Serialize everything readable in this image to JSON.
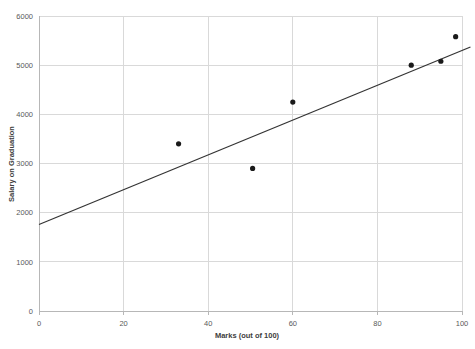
{
  "chart_data": {
    "type": "scatter",
    "title": "",
    "xlabel": "Marks (out of 100)",
    "ylabel": "Salary on Graduation",
    "xlim": [
      0,
      100
    ],
    "ylim": [
      0,
      6000
    ],
    "xticks": [
      0,
      20,
      40,
      60,
      80,
      100
    ],
    "yticks": [
      0,
      1000,
      2000,
      3000,
      4000,
      5000,
      6000
    ],
    "xtick_labels": [
      "0",
      "20",
      "40",
      "60",
      "80",
      "100"
    ],
    "ytick_labels": [
      "0",
      "1000",
      "2000",
      "3000",
      "4000",
      "5000",
      "6000"
    ],
    "grid": "horizontal-and-vertical",
    "legend": "none",
    "points": [
      {
        "x": 33,
        "y": 3400
      },
      {
        "x": 50.5,
        "y": 2900
      },
      {
        "x": 60,
        "y": 4250
      },
      {
        "x": 88,
        "y": 5000
      },
      {
        "x": 95,
        "y": 5080
      },
      {
        "x": 98.5,
        "y": 5580
      }
    ],
    "series": [
      {
        "name": "Salary on Graduation",
        "x": [
          33,
          50.5,
          60,
          88,
          95,
          98.5
        ],
        "values": [
          3400,
          2900,
          4250,
          5000,
          5080,
          5580
        ]
      }
    ],
    "trendline": {
      "type": "linear",
      "x_start": 0,
      "y_start": 1760,
      "x_end": 102,
      "y_end": 5370
    },
    "marker_color": "#1a1a1a",
    "line_color": "#333333",
    "grid_color": "#d9d9d9",
    "axis_color": "#b7b7b7",
    "text_color": "#595959"
  }
}
